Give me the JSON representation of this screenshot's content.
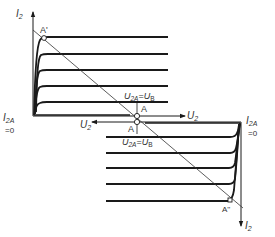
{
  "diagram": {
    "upper": {
      "y_axis_label": "I",
      "y_axis_sub": "2",
      "x_axis_label": "U",
      "x_axis_sub": "2",
      "origin_label_main": "I",
      "origin_label_sub": "2A",
      "origin_label_eq": "=0",
      "point_top": "A'",
      "point_op": "A",
      "op_condition": {
        "u": "U",
        "u_sub": "2A",
        "eq": "=",
        "v": "U",
        "v_sub": "B"
      }
    },
    "lower": {
      "y_axis_label": "I",
      "y_axis_sub": "2",
      "x_axis_label": "U",
      "x_axis_sub": "2",
      "origin_label_main": "I",
      "origin_label_sub": "2A",
      "origin_label_eq": "=0",
      "point_bottom": "A''",
      "point_op": "A",
      "op_condition": {
        "u": "U",
        "u_sub": "2A",
        "eq": "=",
        "v": "U",
        "v_sub": "B"
      }
    },
    "curve_count_upper": 5,
    "curve_count_lower": 5,
    "colors": {
      "line": "#1a1a1a",
      "thin": "#333333",
      "background": "#ffffff"
    }
  }
}
